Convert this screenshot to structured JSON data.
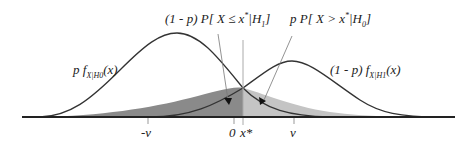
{
  "labels": {
    "left_prob": "(1 - p) P[ X ≤ x* | H₁ ]",
    "right_prob": "p P[ X > x* | H₀ ]",
    "left_density": "p f_X|H0(x)",
    "right_density": "(1 - p) f_X|H1(x)"
  },
  "left_density": {
    "prefix": "p f",
    "sub": "X|H0",
    "suffix": "(x)"
  },
  "right_density": {
    "prefix": "(1 - p) f",
    "sub": "X|H1",
    "suffix": "(x)"
  },
  "left_prob": {
    "prefix": "(1 - p) P[ X ≤ x",
    "sup": "*",
    "mid": "|H",
    "sub": "1",
    "suffix": "]"
  },
  "right_prob": {
    "prefix": "p P[ X > x",
    "sup": "*",
    "mid": "|H",
    "sub": "0",
    "suffix": "]"
  },
  "ticks": [
    {
      "label": "-v",
      "x": 148
    },
    {
      "label": "0",
      "x": 234
    },
    {
      "label": "x*",
      "x": 243
    },
    {
      "label": "v",
      "x": 294
    }
  ],
  "colors": {
    "dark_region": "#8a8a8a",
    "light_region": "#c4c4c4",
    "curve": "#333333",
    "axis": "#222222"
  }
}
